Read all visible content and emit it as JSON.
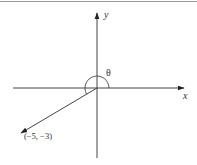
{
  "diagram": {
    "axes": {
      "x_label": "x",
      "y_label": "y"
    },
    "angle_label": "θ",
    "vector": {
      "point_label": "(−5, −3)",
      "x": -5,
      "y": -3
    },
    "colors": {
      "stroke": "#333333",
      "topline": "#9a9a9a"
    }
  }
}
